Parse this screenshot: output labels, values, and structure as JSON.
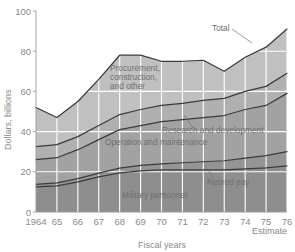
{
  "chart_data": {
    "type": "area",
    "stacked": true,
    "title": "",
    "xlabel": "Fiscal years",
    "ylabel": "Dollars, billions",
    "xlim": [
      1964,
      1976
    ],
    "ylim": [
      0,
      100
    ],
    "yticks": [
      0,
      20,
      40,
      60,
      80,
      100
    ],
    "grid": true,
    "legend_position": "inline-annotations",
    "x": [
      1964,
      1965,
      1966,
      1967,
      1968,
      1969,
      1970,
      1971,
      1972,
      1973,
      1974,
      1975,
      1976
    ],
    "xticklabels": [
      "1964",
      "65",
      "66",
      "67",
      "68",
      "69",
      "70",
      "71",
      "72",
      "73",
      "74",
      "75",
      "76"
    ],
    "estimate_note": "Estimate",
    "estimate_years": [
      "75",
      "76"
    ],
    "series": [
      {
        "name": "Military personnel",
        "color": "#8e8e8e",
        "values": [
          12.5,
          13.0,
          15.0,
          17.5,
          19.5,
          20.5,
          21.0,
          21.0,
          21.0,
          21.0,
          21.5,
          22.0,
          23.0
        ]
      },
      {
        "name": "Retired pay",
        "color": "#949494",
        "values": [
          1.2,
          1.5,
          1.6,
          1.8,
          2.3,
          2.7,
          3.0,
          3.5,
          4.0,
          4.5,
          5.3,
          6.0,
          7.0
        ]
      },
      {
        "name": "Operation and maintenance",
        "color": "#a2a2a2",
        "values": [
          12.3,
          12.5,
          14.4,
          16.7,
          19.2,
          19.8,
          21.0,
          21.5,
          22.0,
          22.5,
          24.2,
          25.0,
          29.0
        ]
      },
      {
        "name": "Research and development",
        "color": "#b0b0b0",
        "values": [
          6.5,
          6.5,
          6.5,
          7.0,
          7.5,
          8.0,
          8.0,
          8.0,
          8.5,
          8.5,
          9.0,
          9.5,
          10.0
        ]
      },
      {
        "name": "Procurement, construction, and other",
        "color": "#c0c0c0",
        "values": [
          19.5,
          13.5,
          17.5,
          23.0,
          29.5,
          27.0,
          22.0,
          21.0,
          20.0,
          13.5,
          17.0,
          19.5,
          22.0
        ]
      }
    ],
    "totals": [
      52.0,
      47.0,
      55.0,
      66.0,
      78.0,
      78.0,
      75.0,
      75.0,
      75.5,
      70.0,
      77.0,
      82.0,
      91.0
    ],
    "total_label": "Total",
    "annotations": [
      {
        "text": "Total",
        "target_year": 1974
      },
      {
        "text": "Procurement, construction, and other",
        "placement": "inside-band-5"
      },
      {
        "text": "Research and development",
        "placement": "inside-band-4"
      },
      {
        "text": "Operation and maintenance",
        "placement": "inside-band-3"
      },
      {
        "text": "Retired pay",
        "placement": "leader-to-band-2"
      },
      {
        "text": "Military personnel",
        "placement": "inside-band-1"
      }
    ],
    "label_lines": {
      "procurement": [
        "Procurement,",
        "construction,",
        "and other"
      ]
    },
    "background_color": "#ffffff",
    "grid_color": "#ffffff",
    "line_color": "#3a3a3a"
  }
}
